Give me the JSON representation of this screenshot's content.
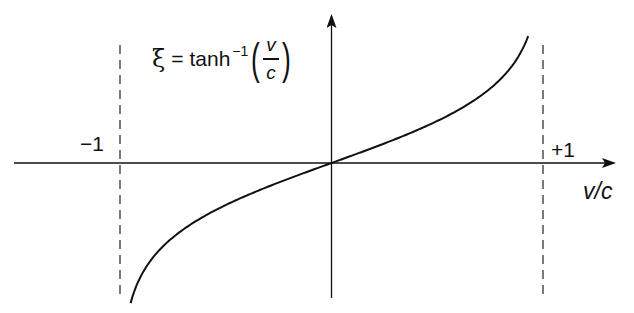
{
  "figure": {
    "formula": {
      "lhs": "ξ",
      "equals": "=",
      "func": "tanh",
      "exponent": "−1",
      "open_paren": "(",
      "numerator": "v",
      "denominator": "c",
      "close_paren": ")"
    },
    "labels": {
      "minus_one": "−1",
      "plus_one": "+1",
      "x_axis": "v/c"
    },
    "colors": {
      "line": "#111111",
      "background": "#ffffff"
    }
  },
  "chart_data": {
    "type": "line",
    "xlabel": "v/c",
    "ylabel": "ξ",
    "xlim": [
      -1,
      1
    ],
    "asymptotes": [
      -1,
      1
    ],
    "annotations": [
      "−1",
      "+1",
      "ξ = tanh⁻¹(v/c)"
    ],
    "grid": false,
    "series": [
      {
        "name": "tanh⁻¹(v/c)",
        "x": [
          -0.95,
          -0.9,
          -0.75,
          -0.5,
          -0.25,
          0,
          0.25,
          0.5,
          0.75,
          0.9,
          0.93
        ],
        "y": [
          -1.83,
          -1.47,
          -0.97,
          -0.55,
          -0.26,
          0,
          0.26,
          0.55,
          0.97,
          1.47,
          1.66
        ]
      }
    ]
  }
}
